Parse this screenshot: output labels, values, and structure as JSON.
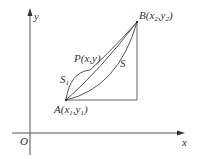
{
  "diagram": {
    "colors": {
      "stroke": "#555555",
      "text": "#333333",
      "background": "#ffffff"
    },
    "axes": {
      "origin_label": "O",
      "x_label": "x",
      "y_label": "y"
    },
    "points": {
      "A": {
        "name": "A",
        "open": "(x",
        "sub1": "1",
        "comma": ",y",
        "sub2": "1",
        "close": ")"
      },
      "B": {
        "name": "B",
        "open": "(x",
        "sub1": "2",
        "comma": ",y",
        "sub2": "2",
        "close": ")"
      },
      "P": {
        "label": "P(x,y)"
      }
    },
    "regions": {
      "S1": {
        "name": "S",
        "sub": "1"
      },
      "S": {
        "label": "S"
      }
    }
  }
}
